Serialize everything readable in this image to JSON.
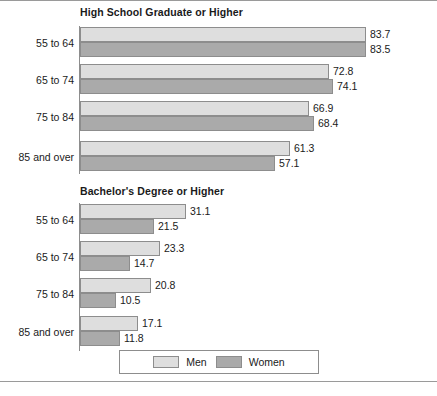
{
  "figure": {
    "rule_top": "",
    "rule_bottom": ""
  },
  "legend": {
    "items": [
      {
        "label": "Men",
        "color": "#dedede"
      },
      {
        "label": "Women",
        "color": "#aaaaaa"
      }
    ]
  },
  "chart_data": [
    {
      "type": "bar",
      "orientation": "horizontal",
      "title": "High School Graduate or Higher",
      "xlabel": "",
      "ylabel": "",
      "categories": [
        "55 to 64",
        "65 to 74",
        "75 to 84",
        "85 and over"
      ],
      "series": [
        {
          "name": "Men",
          "color": "#dedede",
          "values": [
            83.7,
            72.8,
            66.9,
            61.3
          ]
        },
        {
          "name": "Women",
          "color": "#aaaaaa",
          "values": [
            83.5,
            74.1,
            68.4,
            57.1
          ]
        }
      ],
      "xlim": [
        0,
        83.7
      ],
      "grid": false,
      "legend_position": "bottom",
      "data_labels": true
    },
    {
      "type": "bar",
      "orientation": "horizontal",
      "title": "Bachelor's Degree or Higher",
      "xlabel": "",
      "ylabel": "",
      "categories": [
        "55 to 64",
        "65 to 74",
        "75 to 84",
        "85 and over"
      ],
      "series": [
        {
          "name": "Men",
          "color": "#dedede",
          "values": [
            31.1,
            23.3,
            20.8,
            17.1
          ]
        },
        {
          "name": "Women",
          "color": "#aaaaaa",
          "values": [
            21.5,
            14.7,
            10.5,
            11.8
          ]
        }
      ],
      "xlim": [
        0,
        83.7
      ],
      "grid": false,
      "legend_position": "bottom",
      "data_labels": true
    }
  ],
  "labels": {
    "panel0_title": "High School Graduate or Higher",
    "panel1_title": "Bachelor's Degree or Higher",
    "cat0": "55 to 64",
    "cat1": "65 to 74",
    "cat2": "75 to 84",
    "cat3": "85 and over",
    "p0_m0": "83.7",
    "p0_w0": "83.5",
    "p0_m1": "72.8",
    "p0_w1": "74.1",
    "p0_m2": "66.9",
    "p0_w2": "68.4",
    "p0_m3": "61.3",
    "p0_w3": "57.1",
    "p1_m0": "31.1",
    "p1_w0": "21.5",
    "p1_m1": "23.3",
    "p1_w1": "14.7",
    "p1_m2": "20.8",
    "p1_w2": "10.5",
    "p1_m3": "17.1",
    "p1_w3": "11.8"
  }
}
